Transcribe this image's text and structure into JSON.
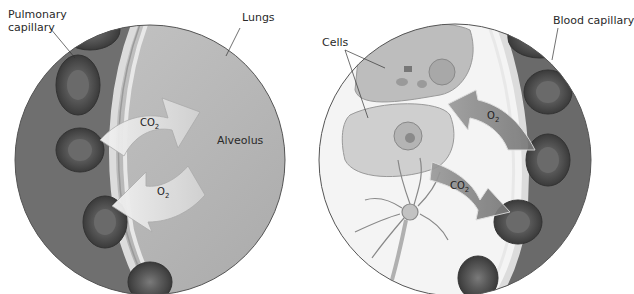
{
  "left_panel": {
    "labels": {
      "pulmonary_capillary_line1": "Pulmonary",
      "pulmonary_capillary_line2": "capillary",
      "lungs": "Lungs",
      "alveolus": "Alveolus"
    },
    "arrows": {
      "co2": {
        "base": "CO",
        "sub": "2"
      },
      "o2": {
        "base": "O",
        "sub": "2"
      }
    }
  },
  "right_panel": {
    "labels": {
      "cells": "Cells",
      "blood_capillary": "Blood capillary"
    },
    "arrows": {
      "o2": {
        "base": "O",
        "sub": "2"
      },
      "co2": {
        "base": "CO",
        "sub": "2"
      }
    }
  },
  "colors": {
    "background": "#ffffff",
    "alveolus_fill": "#bdbdbd",
    "capillary_fill": "#6e6e6e",
    "rbc_fill": "#5a5a5a",
    "membrane": "#d9d9d9",
    "cell_fill": "#c8c8c8",
    "arrow_light": "#e4e4e4",
    "arrow_dark": "#8a8a8a"
  }
}
